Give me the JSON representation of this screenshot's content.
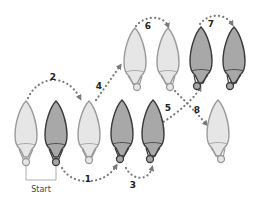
{
  "diagram": {
    "colors": {
      "light_fill": "#e6e6e6",
      "light_stroke": "#9a9a9a",
      "dark_fill": "#a8a8a8",
      "dark_stroke": "#3a3a3a",
      "arrow": "#7a7a7a",
      "text": "#222222"
    },
    "start_label": "Start",
    "feet": [
      {
        "id": "f1",
        "shade": "light",
        "x": 26,
        "y": 101
      },
      {
        "id": "f2",
        "shade": "dark",
        "x": 56,
        "y": 101
      },
      {
        "id": "f3",
        "shade": "light",
        "x": 89,
        "y": 101
      },
      {
        "id": "f4",
        "shade": "dark",
        "x": 122,
        "y": 100
      },
      {
        "id": "f5",
        "shade": "dark",
        "x": 153,
        "y": 100
      },
      {
        "id": "f6",
        "shade": "light",
        "x": 135,
        "y": 28
      },
      {
        "id": "f7",
        "shade": "light",
        "x": 168,
        "y": 28
      },
      {
        "id": "f8",
        "shade": "dark",
        "x": 201,
        "y": 27
      },
      {
        "id": "f9",
        "shade": "dark",
        "x": 234,
        "y": 27
      },
      {
        "id": "f10",
        "shade": "light",
        "x": 218,
        "y": 100
      }
    ],
    "steps": [
      {
        "label": "1",
        "lx": 88,
        "ly": 182
      },
      {
        "label": "2",
        "lx": 52,
        "ly": 79
      },
      {
        "label": "3",
        "lx": 133,
        "ly": 188
      },
      {
        "label": "4",
        "lx": 96,
        "ly": 89
      },
      {
        "label": "5",
        "lx": 167,
        "ly": 111
      },
      {
        "label": "6",
        "lx": 147,
        "ly": 28
      },
      {
        "label": "7",
        "lx": 211,
        "ly": 24
      },
      {
        "label": "8",
        "lx": 196,
        "ly": 112
      }
    ]
  }
}
